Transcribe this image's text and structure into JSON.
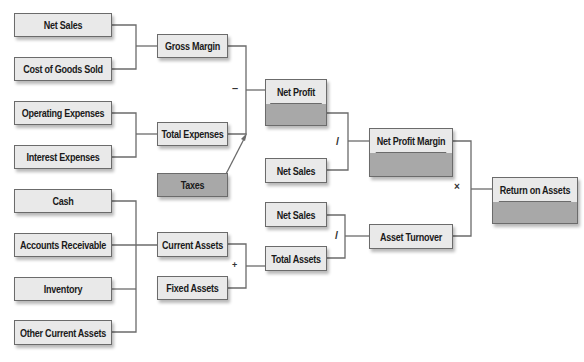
{
  "diagram": {
    "colors": {
      "box_fill": "#e9e9e9",
      "value_fill": "#a8a8a8",
      "border": "#6b6b6b",
      "line": "#6b6b6b"
    },
    "inputs": {
      "net_sales": "Net Sales",
      "cost_of_goods_sold": "Cost of Goods Sold",
      "operating_expenses": "Operating Expenses",
      "interest_expenses": "Interest Expenses",
      "cash": "Cash",
      "accounts_receivable": "Accounts Receivable",
      "inventory": "Inventory",
      "other_current_assets": "Other Current Assets",
      "taxes": "Taxes",
      "fixed_assets": "Fixed Assets"
    },
    "intermediates": {
      "gross_margin": "Gross Margin",
      "total_expenses": "Total Expenses",
      "current_assets": "Current Assets",
      "net_profit": "Net Profit",
      "net_sales_margin": "Net Sales",
      "net_sales_turnover": "Net Sales",
      "total_assets": "Total Assets",
      "net_profit_margin": "Net Profit Margin",
      "asset_turnover": "Asset Turnover"
    },
    "result": {
      "return_on_assets": "Return on Assets"
    },
    "operators": {
      "subtract": "–",
      "divide_margin": "/",
      "divide_turnover": "/",
      "add_assets": "+",
      "multiply": "×"
    }
  }
}
